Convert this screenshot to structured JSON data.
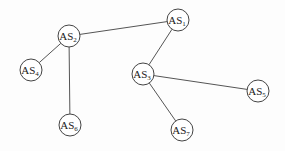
{
  "diagram": {
    "type": "network-topology",
    "nodes": [
      {
        "id": "AS1",
        "prefix": "AS",
        "sub": "1",
        "x": 178,
        "y": 20
      },
      {
        "id": "AS2",
        "prefix": "AS",
        "sub": "2",
        "x": 69,
        "y": 36
      },
      {
        "id": "AS3",
        "prefix": "AS",
        "sub": "3",
        "x": 143,
        "y": 74
      },
      {
        "id": "AS4",
        "prefix": "AS",
        "sub": "4",
        "x": 31,
        "y": 70
      },
      {
        "id": "AS5",
        "prefix": "AS",
        "sub": "5",
        "x": 258,
        "y": 91
      },
      {
        "id": "AS6",
        "prefix": "AS",
        "sub": "6",
        "x": 70,
        "y": 125
      },
      {
        "id": "AS7",
        "prefix": "AS",
        "sub": "7",
        "x": 182,
        "y": 130
      }
    ],
    "edges": [
      {
        "from": "AS2",
        "to": "AS1"
      },
      {
        "from": "AS2",
        "to": "AS4"
      },
      {
        "from": "AS2",
        "to": "AS6"
      },
      {
        "from": "AS1",
        "to": "AS3"
      },
      {
        "from": "AS3",
        "to": "AS5"
      },
      {
        "from": "AS3",
        "to": "AS7"
      }
    ],
    "node_radius": 11,
    "colors": {
      "stroke": "#444444",
      "edge": "#555555",
      "text": "#222222",
      "fill": "#ffffff"
    }
  }
}
